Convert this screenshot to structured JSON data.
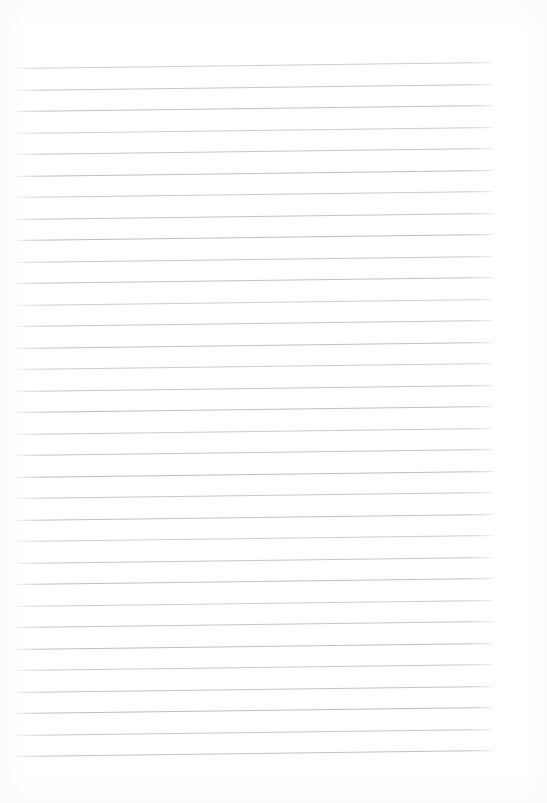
{
  "document": {
    "kind": "scanned-lined-paper",
    "title": "",
    "body_text": "",
    "page_width": 547,
    "page_height": 803,
    "background_color": "#ffffff"
  },
  "ruling": {
    "line_color": "#b9bcc2",
    "line_thickness": 1,
    "line_count": 33,
    "line_spacing": 21.5,
    "left_x": 15,
    "right_x": 493,
    "first_line_y_left": 68,
    "last_line_y_left": 757,
    "skew_degrees": -0.72,
    "has_margin_rule": false,
    "has_header": false,
    "has_holes": false
  },
  "content": {
    "written_text": [],
    "annotations": [],
    "note": ""
  }
}
